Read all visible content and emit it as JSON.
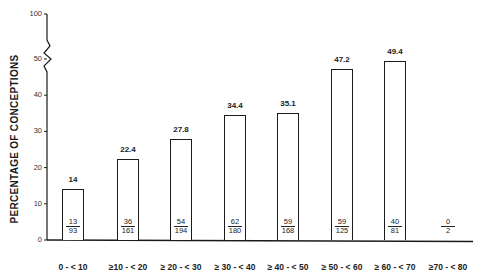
{
  "chart_data": {
    "type": "bar",
    "title": "",
    "xlabel": "",
    "ylabel": "PERCENTAGE OF CONCEPTIONS",
    "ylim": [
      0,
      100
    ],
    "y_axis_break": {
      "between": [
        50,
        100
      ]
    },
    "yticks": [
      0,
      10,
      20,
      30,
      40,
      50,
      100
    ],
    "grid": false,
    "legend": null,
    "categories": [
      "0 - < 10",
      "≥10 - < 20",
      "≥ 20 - < 30",
      "≥ 30 - < 40",
      "≥ 40 - < 50",
      "≥ 50 - < 60",
      "≥ 60 - < 70",
      "≥70 - < 80"
    ],
    "values": [
      14,
      22.4,
      27.8,
      34.4,
      35.1,
      47.2,
      49.4,
      0
    ],
    "value_labels": [
      "14",
      "22.4",
      "27.8",
      "34.4",
      "35.1",
      "47.2",
      "49.4",
      ""
    ],
    "fractions": [
      {
        "num": "13",
        "den": "93"
      },
      {
        "num": "36",
        "den": "161"
      },
      {
        "num": "54",
        "den": "194"
      },
      {
        "num": "62",
        "den": "180"
      },
      {
        "num": "59",
        "den": "168"
      },
      {
        "num": "59",
        "den": "125"
      },
      {
        "num": "40",
        "den": "81"
      },
      {
        "num": "0",
        "den": "2"
      }
    ]
  },
  "colors": {
    "bar_fill": "#ffffff",
    "bar_stroke": "#1a1a1a",
    "axis": "#1a1a1a"
  }
}
